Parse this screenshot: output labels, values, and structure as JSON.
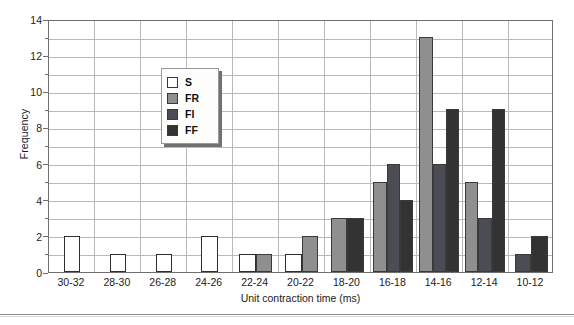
{
  "chart_data": {
    "type": "bar",
    "title": "",
    "xlabel": "Unit contraction time (ms)",
    "ylabel": "Frequency",
    "categories": [
      "30-32",
      "28-30",
      "26-28",
      "24-26",
      "22-24",
      "20-22",
      "18-20",
      "16-18",
      "14-16",
      "12-14",
      "10-12"
    ],
    "series": [
      {
        "name": "S",
        "color": "#ffffff",
        "values": [
          2,
          1,
          1,
          2,
          1,
          1,
          0,
          0,
          0,
          0,
          0
        ]
      },
      {
        "name": "FR",
        "color": "#8f8f8f",
        "values": [
          0,
          0,
          0,
          0,
          1,
          2,
          3,
          5,
          13,
          5,
          0
        ]
      },
      {
        "name": "FI",
        "color": "#4c4c55",
        "values": [
          0,
          0,
          0,
          0,
          0,
          0,
          0,
          6,
          6,
          3,
          1
        ]
      },
      {
        "name": "FF",
        "color": "#333333",
        "values": [
          0,
          0,
          0,
          0,
          0,
          0,
          3,
          4,
          9,
          9,
          2
        ]
      }
    ],
    "ylim": [
      0,
      14
    ],
    "ytick_labels": [
      "0",
      "2",
      "4",
      "6",
      "8",
      "10",
      "12",
      "14"
    ],
    "ytick_values": [
      0,
      2,
      4,
      6,
      8,
      10,
      12,
      14
    ],
    "ygrid_minor_step": 1,
    "grid": true,
    "legend_position": "upper-left-inner",
    "legend_entries": [
      "S",
      "FR",
      "FI",
      "FF"
    ]
  }
}
